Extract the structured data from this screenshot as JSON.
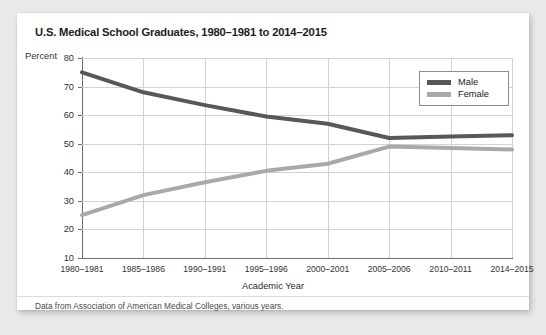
{
  "card": {
    "title": "U.S. Medical School Graduates, 1980–1981 to 2014–2015",
    "source_note": "Data from Association of American Medical Colleges, various years."
  },
  "legend": {
    "items": [
      {
        "label": "Male",
        "color": "#585858"
      },
      {
        "label": "Female",
        "color": "#a9a9a9"
      }
    ]
  },
  "chart_data": {
    "type": "line",
    "title": "U.S. Medical School Graduates, 1980–1981 to 2014–2015",
    "xlabel": "Academic Year",
    "ylabel": "Percent",
    "categories": [
      "1980–1981",
      "1985–1986",
      "1990–1991",
      "1995–1996",
      "2000–2001",
      "2005–2006",
      "2010–2011",
      "2014–2015"
    ],
    "series": [
      {
        "name": "Male",
        "color": "#585858",
        "values": [
          75,
          68,
          63.5,
          59.5,
          57,
          52,
          52.5,
          53
        ]
      },
      {
        "name": "Female",
        "color": "#a9a9a9",
        "values": [
          25,
          32,
          36.5,
          40.5,
          43,
          49,
          48.5,
          48
        ]
      }
    ],
    "ylim": [
      10,
      80
    ],
    "yticks": [
      10,
      20,
      30,
      40,
      50,
      60,
      70,
      80
    ],
    "grid": true,
    "legend_position": "top-right"
  }
}
